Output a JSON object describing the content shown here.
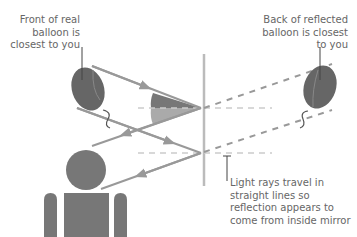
{
  "labels": {
    "real_balloon": "Front of real balloon is closest to you",
    "reflected_balloon": "Back of reflected balloon is closest to you",
    "light_rays": "Light rays travel in straight lines so reflection appears to come from inside mirror"
  },
  "colors": {
    "shape_dark": "#666666",
    "ray": "#999999",
    "dashed_normal": "#cccccc",
    "mirror": "#bbbbbb",
    "wedge_dark": "#777777",
    "wedge_light": "#aaaaaa",
    "text": "#666666"
  }
}
